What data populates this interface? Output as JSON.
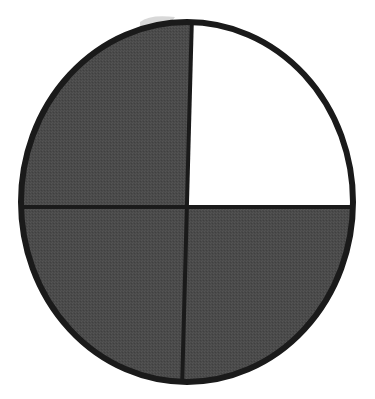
{
  "diagram": {
    "type": "fraction-circle",
    "total_parts": 4,
    "shaded_parts": 3,
    "fraction_shaded": "3/4",
    "parts": [
      {
        "position": "top-left",
        "shaded": true
      },
      {
        "position": "top-right",
        "shaded": false
      },
      {
        "position": "bottom-left",
        "shaded": true
      },
      {
        "position": "bottom-right",
        "shaded": true
      }
    ],
    "colors": {
      "shaded": "#4a4a4a",
      "unshaded": "#ffffff",
      "outline": "#1a1a1a",
      "background": "#ffffff"
    },
    "geometry": {
      "cx": 187,
      "cy": 202,
      "rx": 166,
      "ry": 180,
      "divider_y": 207,
      "divider_top_x": 192,
      "divider_bottom_x": 182
    }
  }
}
